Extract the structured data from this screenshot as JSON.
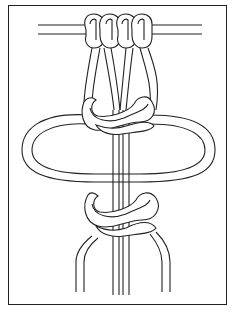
{
  "figure": {
    "colors": {
      "line": "#222222",
      "background": "#ffffff"
    },
    "elements": {
      "mounting_bar": "horizontal dowel with two mounted cords",
      "mount_knots": 2,
      "square_knots": 2,
      "side_loop": "large oval loop",
      "hanging_cord_ends": 7
    }
  }
}
